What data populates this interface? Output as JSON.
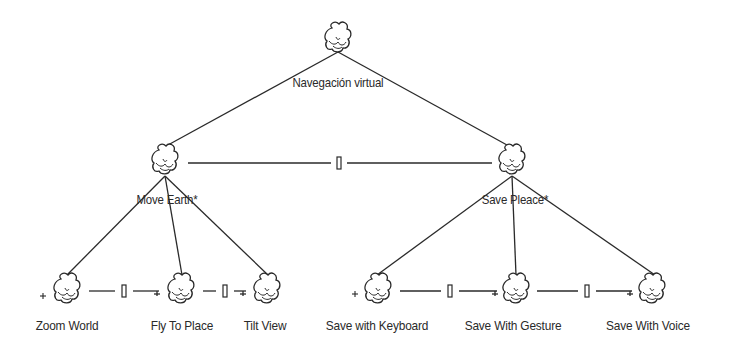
{
  "diagram": {
    "type": "task-model-tree",
    "root": {
      "label": "Navegación virtual",
      "icon": "cloud-icon"
    },
    "subtasks": [
      {
        "label": "Move Earth*",
        "icon": "cloud-icon",
        "children": [
          {
            "label": "Zoom World",
            "icon": "cloud-icon",
            "prefix": "+"
          },
          {
            "label": "Fly To Place",
            "icon": "cloud-icon"
          },
          {
            "label": "Tilt View",
            "icon": "cloud-icon"
          }
        ],
        "operators": [
          "[]",
          "[]"
        ]
      },
      {
        "label": "Save Pleace*",
        "icon": "cloud-icon",
        "children": [
          {
            "label": "Save with Keyboard",
            "icon": "cloud-icon",
            "prefix": "+"
          },
          {
            "label": "Save With Gesture",
            "icon": "cloud-icon"
          },
          {
            "label": "Save With Voice",
            "icon": "cloud-icon"
          }
        ],
        "operators": [
          "[]",
          "[]"
        ]
      }
    ],
    "sibling_operator": "[]",
    "colors": {
      "line": "#2a2a2a",
      "background": "#ffffff"
    }
  }
}
